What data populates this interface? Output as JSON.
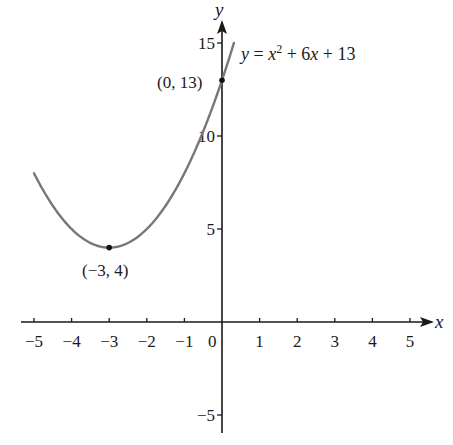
{
  "chart_data": {
    "type": "line",
    "title": "",
    "xlabel": "x",
    "ylabel": "y",
    "xlim": [
      -5.3,
      5.6
    ],
    "ylim": [
      -6,
      16
    ],
    "grid": false,
    "x_ticks": [
      -5,
      -4,
      -3,
      -2,
      -1,
      0,
      1,
      2,
      3,
      4,
      5
    ],
    "x_tick_labels": [
      "−5",
      "−4",
      "−3",
      "−2",
      "−1",
      "0",
      "1",
      "2",
      "3",
      "4",
      "5"
    ],
    "y_ticks": [
      15,
      10,
      5,
      -5
    ],
    "y_tick_labels": [
      "15",
      "10",
      "5",
      "−5"
    ],
    "series": [
      {
        "name": "y = x² + 6x + 13",
        "equation": "y = x^2 + 6x + 13",
        "color": "#777777",
        "x_range": [
          -5,
          0.317
        ],
        "x": [
          -5,
          -4.5,
          -4,
          -3.5,
          -3,
          -2.5,
          -2,
          -1.5,
          -1,
          -0.5,
          0,
          0.317
        ],
        "y": [
          8,
          6.25,
          5,
          4.25,
          4,
          4.25,
          5,
          6.25,
          8,
          10.25,
          13,
          15
        ]
      }
    ],
    "points": [
      {
        "x": -3,
        "y": 4,
        "label": "(−3, 4)",
        "note": "vertex / minimum"
      },
      {
        "x": 0,
        "y": 13,
        "label": "(0, 13)",
        "note": "y-intercept"
      }
    ],
    "annotations": [
      {
        "text": "y = x² + 6x + 13",
        "position": "upper right of curve end"
      }
    ]
  },
  "labels": {
    "x_axis": "x",
    "y_axis": "y",
    "origin": "0",
    "eq_y": "y",
    "eq_eq": " = ",
    "eq_x": "x",
    "eq_sup": "2",
    "eq_mid": " + 6",
    "eq_x2": "x",
    "eq_end": " + 13",
    "vertex": "(−3, 4)",
    "intercept": "(0, 13)"
  },
  "colors": {
    "axis": "#1a1a1a",
    "curve": "#777777",
    "point": "#111111"
  }
}
